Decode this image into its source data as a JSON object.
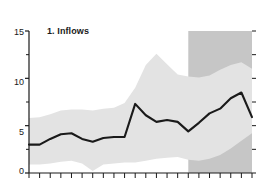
{
  "chart": {
    "title": "1. Inflows",
    "colors": {
      "line": "#1a1a1a",
      "band": "#e3e3e3",
      "forecast_shade": "#c6c6c6",
      "axis": "#1a1a1a",
      "background": "#ffffff"
    }
  },
  "y_axis": {
    "labels": [
      "15",
      "10",
      "5",
      "0"
    ],
    "label_values": [
      15,
      10,
      5,
      0
    ],
    "minor_ticks": [
      12.5,
      7.5,
      2.5
    ]
  },
  "chart_data": {
    "type": "area",
    "title": "1. Inflows",
    "xlabel": "",
    "ylabel": "",
    "ylim": [
      0,
      15
    ],
    "yticks": [
      0,
      5,
      10,
      15
    ],
    "yticks_minor": [
      2.5,
      7.5,
      12.5
    ],
    "grid": false,
    "legend": "none",
    "x": [
      1,
      2,
      3,
      4,
      5,
      6,
      7,
      8,
      9,
      10,
      11,
      12,
      13,
      14,
      15,
      16,
      17,
      18,
      19,
      20,
      21,
      22
    ],
    "xticks_count": 22,
    "xtick_labels": [],
    "series": [
      {
        "name": "Inflows",
        "type": "line",
        "values": [
          3.0,
          3.0,
          3.6,
          4.1,
          4.2,
          3.6,
          3.3,
          3.7,
          3.8,
          3.8,
          7.3,
          6.1,
          5.4,
          5.6,
          5.4,
          4.4,
          5.3,
          6.3,
          6.8,
          7.9,
          8.5,
          5.9
        ]
      },
      {
        "name": "Upper band",
        "type": "band-upper",
        "values": [
          5.8,
          5.9,
          6.2,
          6.6,
          6.7,
          6.7,
          6.6,
          6.8,
          6.9,
          7.4,
          9.0,
          11.4,
          12.6,
          11.5,
          10.4,
          10.2,
          10.1,
          10.3,
          10.9,
          11.4,
          11.7,
          11.0
        ]
      },
      {
        "name": "Lower band",
        "type": "band-lower",
        "values": [
          0.9,
          0.9,
          1.0,
          1.2,
          1.3,
          1.0,
          0.2,
          0.9,
          1.0,
          1.1,
          1.1,
          1.3,
          1.5,
          1.6,
          1.7,
          1.4,
          1.3,
          1.5,
          1.9,
          2.6,
          3.4,
          4.2
        ]
      }
    ],
    "annotations": [
      {
        "name": "forecast-region",
        "type": "vspan",
        "x_start": 16,
        "x_end": 22,
        "color": "#c6c6c6"
      }
    ]
  }
}
